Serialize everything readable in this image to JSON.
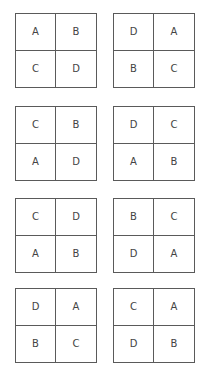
{
  "grids": [
    {
      "cells": [
        "A",
        "B",
        "C",
        "D"
      ]
    },
    {
      "cells": [
        "D",
        "A",
        "B",
        "C"
      ]
    },
    {
      "cells": [
        "C",
        "B",
        "A",
        "D"
      ]
    },
    {
      "cells": [
        "D",
        "C",
        "A",
        "B"
      ]
    },
    {
      "cells": [
        "C",
        "D",
        "A",
        "B"
      ]
    },
    {
      "cells": [
        "B",
        "C",
        "D",
        "A"
      ]
    },
    {
      "cells": [
        "D",
        "A",
        "B",
        "C"
      ]
    },
    {
      "cells": [
        "C",
        "A",
        "D",
        "B"
      ]
    }
  ]
}
